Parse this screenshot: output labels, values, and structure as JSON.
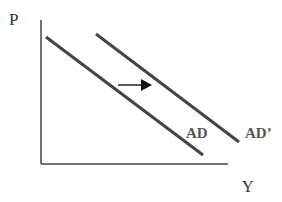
{
  "diagram": {
    "y_axis_label": "P",
    "x_axis_label": "Y",
    "curves": [
      {
        "label": "AD",
        "x1": 46,
        "y1": 37,
        "x2": 203,
        "y2": 155
      },
      {
        "label": "AD’",
        "x1": 96,
        "y1": 34,
        "x2": 239,
        "y2": 142
      }
    ],
    "shift_arrow": {
      "direction": "right"
    },
    "colors": {
      "line": "#444444",
      "text": "#333333"
    }
  }
}
